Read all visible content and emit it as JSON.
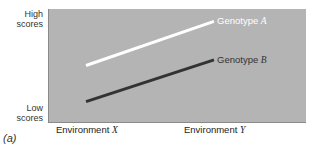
{
  "chart_data": {
    "type": "line",
    "title": "",
    "xlabel": "",
    "ylabel": "",
    "categories": [
      "Environment X",
      "Environment Y"
    ],
    "y_axis_labels": {
      "high": "High scores",
      "low": "Low scores"
    },
    "ylim": [
      0,
      1
    ],
    "series": [
      {
        "name": "Genotype A",
        "values": [
          0.5,
          0.89
        ],
        "color": "#ffffff"
      },
      {
        "name": "Genotype B",
        "values": [
          0.18,
          0.55
        ],
        "color": "#333333"
      }
    ],
    "grid": false,
    "legend": "inline-line-labels"
  },
  "labels": {
    "high_line1": "High",
    "high_line2": "scores",
    "low_line1": "Low",
    "low_line2": "scores",
    "env_word": "Environment",
    "env_x": "X",
    "env_y": "Y",
    "genotype_word": "Genotype",
    "genotype_a": "A",
    "genotype_b": "B",
    "panel": "(a)"
  },
  "colors": {
    "plot_bg": "#b4b4b4",
    "line_a": "#ffffff",
    "line_b": "#333333"
  }
}
